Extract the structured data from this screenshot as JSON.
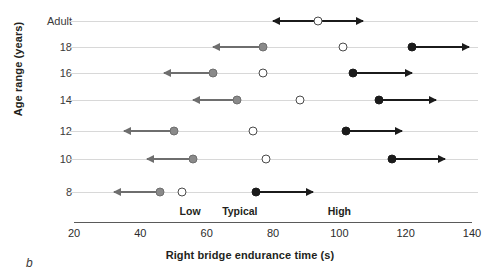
{
  "panel": {
    "letter": "b"
  },
  "chart_data": {
    "type": "scatter",
    "title": "",
    "xlabel": "Right bridge endurance time (s)",
    "ylabel": "Age range (years)",
    "xlim": [
      20,
      140
    ],
    "xticks": [
      20,
      40,
      60,
      80,
      100,
      120,
      140
    ],
    "grid": true,
    "legend_position": "inline-zones",
    "categories": [
      "Adult",
      "18",
      "16",
      "14",
      "12",
      "10",
      "8"
    ],
    "zone_labels": [
      {
        "label": "Low",
        "x": 55
      },
      {
        "label": "Typical",
        "x": 70
      },
      {
        "label": "High",
        "x": 100
      }
    ],
    "series": [
      {
        "name": "Low",
        "marker": "filled-gray",
        "values": [
          null,
          77,
          62,
          69,
          50,
          56,
          46
        ]
      },
      {
        "name": "Typical",
        "marker": "open",
        "values": [
          93.5,
          101,
          77,
          88,
          74,
          78,
          52.5
        ]
      },
      {
        "name": "High",
        "marker": "filled-black",
        "values": [
          null,
          122,
          104,
          112,
          102,
          116,
          75
        ]
      }
    ],
    "rows": [
      {
        "category": "Adult",
        "markers": [
          {
            "series": "Typical",
            "value": 93.5,
            "style": "open",
            "arrow": "both",
            "arrow_left_to": 80,
            "arrow_right_to": 107
          }
        ]
      },
      {
        "category": "18",
        "markers": [
          {
            "series": "Low",
            "value": 77,
            "style": "filled-gray",
            "arrow": "left",
            "arrow_left_to": 62
          },
          {
            "series": "Typical",
            "value": 101,
            "style": "open",
            "arrow": "none"
          },
          {
            "series": "High",
            "value": 122,
            "style": "filled-black",
            "arrow": "right",
            "arrow_right_to": 139
          }
        ]
      },
      {
        "category": "16",
        "markers": [
          {
            "series": "Low",
            "value": 62,
            "style": "filled-gray",
            "arrow": "left",
            "arrow_left_to": 47
          },
          {
            "series": "Typical",
            "value": 77,
            "style": "open",
            "arrow": "none"
          },
          {
            "series": "High",
            "value": 104,
            "style": "filled-black",
            "arrow": "right",
            "arrow_right_to": 122
          }
        ]
      },
      {
        "category": "14",
        "markers": [
          {
            "series": "Low",
            "value": 69,
            "style": "filled-gray",
            "arrow": "left",
            "arrow_left_to": 56
          },
          {
            "series": "Typical",
            "value": 88,
            "style": "open",
            "arrow": "none"
          },
          {
            "series": "High",
            "value": 112,
            "style": "filled-black",
            "arrow": "right",
            "arrow_right_to": 129
          }
        ]
      },
      {
        "category": "12",
        "markers": [
          {
            "series": "Low",
            "value": 50,
            "style": "filled-gray",
            "arrow": "left",
            "arrow_left_to": 35
          },
          {
            "series": "Typical",
            "value": 74,
            "style": "open",
            "arrow": "none"
          },
          {
            "series": "High",
            "value": 102,
            "style": "filled-black",
            "arrow": "right",
            "arrow_right_to": 119
          }
        ]
      },
      {
        "category": "10",
        "markers": [
          {
            "series": "Low",
            "value": 56,
            "style": "filled-gray",
            "arrow": "left",
            "arrow_left_to": 42
          },
          {
            "series": "Typical",
            "value": 78,
            "style": "open",
            "arrow": "none"
          },
          {
            "series": "High",
            "value": 116,
            "style": "filled-black",
            "arrow": "right",
            "arrow_right_to": 132
          }
        ]
      },
      {
        "category": "8",
        "markers": [
          {
            "series": "Low",
            "value": 46,
            "style": "filled-gray",
            "arrow": "left",
            "arrow_left_to": 32
          },
          {
            "series": "Typical",
            "value": 52.5,
            "style": "open",
            "arrow": "none"
          },
          {
            "series": "High",
            "value": 75,
            "style": "filled-black",
            "arrow": "right",
            "arrow_right_to": 92
          }
        ]
      }
    ]
  }
}
